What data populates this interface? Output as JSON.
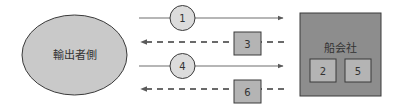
{
  "diagram": {
    "colors": {
      "line": "#6e6e6e",
      "outline": "#3a3a3a",
      "ellipse_fill": "#c9c9c9",
      "circle_fill": "#dcdcdc",
      "box_fill": "#b4b4b4",
      "company_fill": "#8d8d8d",
      "text": "#333333"
    },
    "exporter": {
      "label": "輸出者側"
    },
    "shipping_company": {
      "label": "船会社",
      "inner_boxes": [
        {
          "label": "2"
        },
        {
          "label": "5"
        }
      ]
    },
    "flows": [
      {
        "step": "1",
        "direction": "to-shipping-company",
        "style": "solid",
        "marker": "circle"
      },
      {
        "step": "3",
        "direction": "to-exporter",
        "style": "dashed",
        "marker": "square"
      },
      {
        "step": "4",
        "direction": "to-shipping-company",
        "style": "solid",
        "marker": "circle"
      },
      {
        "step": "6",
        "direction": "to-exporter",
        "style": "dashed",
        "marker": "square"
      }
    ]
  }
}
